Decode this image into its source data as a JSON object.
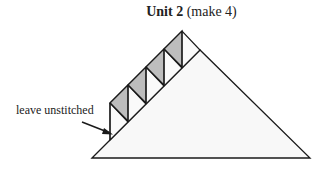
{
  "title": {
    "bold": "Unit 2",
    "normal": " (make 4)"
  },
  "annotation": {
    "text": "leave unstitched"
  },
  "colors": {
    "stroke": "#1a1a1a",
    "shaded": "#bdbdbd",
    "fill": "#f7f7f7"
  },
  "units_count": 4
}
